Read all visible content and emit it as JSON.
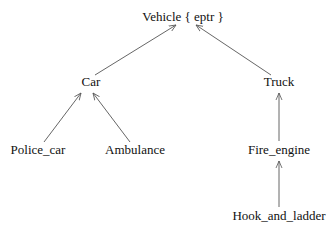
{
  "diagram": {
    "type": "inheritance-tree",
    "nodes": [
      {
        "id": "vehicle",
        "label": "Vehicle { eptr }",
        "x": 183,
        "y": 17
      },
      {
        "id": "car",
        "label": "Car",
        "x": 91,
        "y": 82
      },
      {
        "id": "truck",
        "label": "Truck",
        "x": 279,
        "y": 82
      },
      {
        "id": "police_car",
        "label": "Police_car",
        "x": 38,
        "y": 150
      },
      {
        "id": "ambulance",
        "label": "Ambulance",
        "x": 135,
        "y": 150
      },
      {
        "id": "fire_engine",
        "label": "Fire_engine",
        "x": 279,
        "y": 150
      },
      {
        "id": "hook_and_ladder",
        "label": "Hook_and_ladder",
        "x": 279,
        "y": 216
      }
    ],
    "edges": [
      {
        "from": "car",
        "to": "vehicle",
        "x1": 95,
        "y1": 75,
        "x2": 176,
        "y2": 25
      },
      {
        "from": "truck",
        "to": "vehicle",
        "x1": 271,
        "y1": 75,
        "x2": 196,
        "y2": 25
      },
      {
        "from": "police_car",
        "to": "car",
        "x1": 44,
        "y1": 142,
        "x2": 81,
        "y2": 93
      },
      {
        "from": "ambulance",
        "to": "car",
        "x1": 130,
        "y1": 142,
        "x2": 93,
        "y2": 93
      },
      {
        "from": "fire_engine",
        "to": "truck",
        "x1": 279,
        "y1": 141,
        "x2": 279,
        "y2": 93
      },
      {
        "from": "hook_and_ladder",
        "to": "fire_engine",
        "x1": 279,
        "y1": 207,
        "x2": 279,
        "y2": 161
      }
    ],
    "line_color": "#555555"
  }
}
